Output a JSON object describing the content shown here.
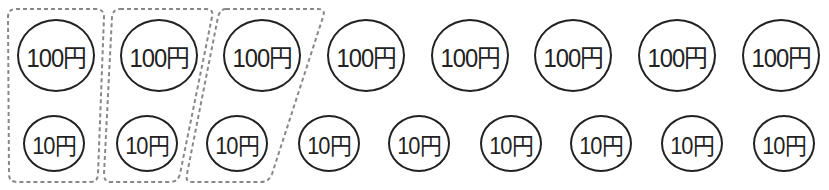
{
  "diagram": {
    "colors": {
      "stroke": "#222222",
      "dash": "#888888",
      "background": "#ffffff"
    },
    "top_row": {
      "label": "100円",
      "coins": [
        {
          "label": "100円",
          "cx": 56,
          "cy": 55
        },
        {
          "label": "100円",
          "cx": 159,
          "cy": 55
        },
        {
          "label": "100円",
          "cx": 262,
          "cy": 55
        },
        {
          "label": "100円",
          "cx": 366,
          "cy": 55
        },
        {
          "label": "100円",
          "cx": 470,
          "cy": 55
        },
        {
          "label": "100円",
          "cx": 573,
          "cy": 55
        },
        {
          "label": "100円",
          "cx": 677,
          "cy": 55
        },
        {
          "label": "100円",
          "cx": 781,
          "cy": 55
        }
      ]
    },
    "bottom_row": {
      "label": "10円",
      "coins": [
        {
          "label": "10円",
          "cx": 54,
          "cy": 143
        },
        {
          "label": "10円",
          "cx": 147,
          "cy": 143
        },
        {
          "label": "10円",
          "cx": 237,
          "cy": 143
        },
        {
          "label": "10円",
          "cx": 329,
          "cy": 143
        },
        {
          "label": "10円",
          "cx": 419,
          "cy": 143
        },
        {
          "label": "10円",
          "cx": 511,
          "cy": 143
        },
        {
          "label": "10円",
          "cx": 601,
          "cy": 143
        },
        {
          "label": "10円",
          "cx": 692,
          "cy": 143
        },
        {
          "label": "10円",
          "cx": 784,
          "cy": 143
        }
      ]
    },
    "groups": [
      {
        "name": "group-1",
        "contains": [
          "100円",
          "10円"
        ]
      },
      {
        "name": "group-2",
        "contains": [
          "100円",
          "10円"
        ]
      },
      {
        "name": "group-3",
        "contains": [
          "100円",
          "10円"
        ]
      }
    ]
  }
}
